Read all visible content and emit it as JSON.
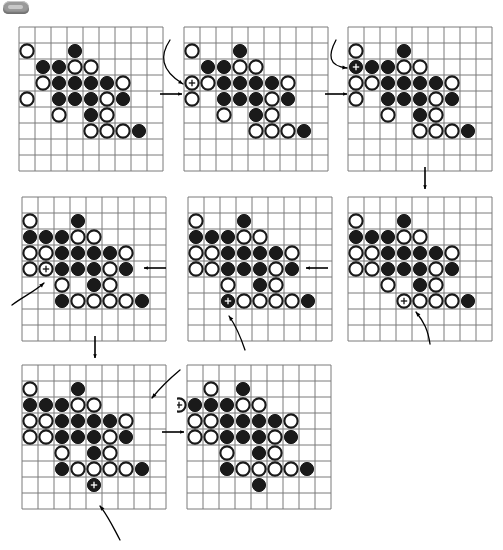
{
  "page": {
    "tab_chip_label": "",
    "background_color": "#ffffff",
    "stone_black_color": "#1a1a1a",
    "stone_white_color": "#ffffff",
    "grid_line_color": "#7a7a7a",
    "arrow_color": "#000000"
  },
  "board_spec": {
    "cols": 9,
    "rows": 9,
    "cell_px": 16,
    "stone_radius_px": 6.6,
    "note": "stones sit at cell centres, col/row are 0-indexed from top-left"
  },
  "boards": [
    {
      "id": "board-1",
      "label": "position-1",
      "x": 19,
      "y": 27,
      "black": [
        [
          3,
          1
        ],
        [
          1,
          2
        ],
        [
          2,
          2
        ],
        [
          2,
          3
        ],
        [
          3,
          3
        ],
        [
          4,
          3
        ],
        [
          5,
          3
        ],
        [
          2,
          4
        ],
        [
          3,
          4
        ],
        [
          4,
          4
        ],
        [
          6,
          4
        ],
        [
          4,
          5
        ],
        [
          7,
          6
        ]
      ],
      "white": [
        [
          0,
          1
        ],
        [
          3,
          2
        ],
        [
          4,
          2
        ],
        [
          1,
          3
        ],
        [
          6,
          3
        ],
        [
          0,
          4
        ],
        [
          5,
          4
        ],
        [
          2,
          5
        ],
        [
          5,
          5
        ],
        [
          4,
          6
        ],
        [
          5,
          6
        ],
        [
          6,
          6
        ]
      ],
      "marked": []
    },
    {
      "id": "board-2",
      "label": "position-2",
      "x": 184,
      "y": 27,
      "black": [
        [
          3,
          1
        ],
        [
          1,
          2
        ],
        [
          2,
          2
        ],
        [
          2,
          3
        ],
        [
          3,
          3
        ],
        [
          4,
          3
        ],
        [
          5,
          3
        ],
        [
          2,
          4
        ],
        [
          3,
          4
        ],
        [
          4,
          4
        ],
        [
          6,
          4
        ],
        [
          4,
          5
        ],
        [
          7,
          6
        ]
      ],
      "white": [
        [
          0,
          1
        ],
        [
          3,
          2
        ],
        [
          4,
          2
        ],
        [
          0,
          3
        ],
        [
          1,
          3
        ],
        [
          6,
          3
        ],
        [
          0,
          4
        ],
        [
          5,
          4
        ],
        [
          2,
          5
        ],
        [
          5,
          5
        ],
        [
          4,
          6
        ],
        [
          5,
          6
        ],
        [
          6,
          6
        ]
      ],
      "marked": [
        [
          0,
          3
        ]
      ]
    },
    {
      "id": "board-3",
      "label": "position-3",
      "x": 348,
      "y": 27,
      "black": [
        [
          3,
          1
        ],
        [
          0,
          2
        ],
        [
          1,
          2
        ],
        [
          2,
          2
        ],
        [
          2,
          3
        ],
        [
          3,
          3
        ],
        [
          4,
          3
        ],
        [
          5,
          3
        ],
        [
          2,
          4
        ],
        [
          3,
          4
        ],
        [
          4,
          4
        ],
        [
          6,
          4
        ],
        [
          4,
          5
        ],
        [
          7,
          6
        ]
      ],
      "white": [
        [
          0,
          1
        ],
        [
          3,
          2
        ],
        [
          4,
          2
        ],
        [
          0,
          3
        ],
        [
          1,
          3
        ],
        [
          6,
          3
        ],
        [
          0,
          4
        ],
        [
          5,
          4
        ],
        [
          2,
          5
        ],
        [
          5,
          5
        ],
        [
          4,
          6
        ],
        [
          5,
          6
        ],
        [
          6,
          6
        ]
      ],
      "marked": [
        [
          0,
          2
        ]
      ]
    },
    {
      "id": "board-4",
      "label": "position-4",
      "x": 348,
      "y": 197,
      "black": [
        [
          3,
          1
        ],
        [
          0,
          2
        ],
        [
          1,
          2
        ],
        [
          2,
          2
        ],
        [
          2,
          3
        ],
        [
          3,
          3
        ],
        [
          4,
          3
        ],
        [
          5,
          3
        ],
        [
          2,
          4
        ],
        [
          3,
          4
        ],
        [
          4,
          4
        ],
        [
          6,
          4
        ],
        [
          4,
          5
        ],
        [
          7,
          6
        ]
      ],
      "white": [
        [
          0,
          1
        ],
        [
          3,
          2
        ],
        [
          4,
          2
        ],
        [
          0,
          3
        ],
        [
          1,
          3
        ],
        [
          6,
          3
        ],
        [
          0,
          4
        ],
        [
          1,
          4
        ],
        [
          5,
          4
        ],
        [
          2,
          5
        ],
        [
          5,
          5
        ],
        [
          3,
          6
        ],
        [
          4,
          6
        ],
        [
          5,
          6
        ],
        [
          6,
          6
        ]
      ],
      "marked": [
        [
          3,
          6
        ]
      ]
    },
    {
      "id": "board-5",
      "label": "position-5",
      "x": 188,
      "y": 197,
      "black": [
        [
          3,
          1
        ],
        [
          0,
          2
        ],
        [
          1,
          2
        ],
        [
          2,
          2
        ],
        [
          2,
          3
        ],
        [
          3,
          3
        ],
        [
          4,
          3
        ],
        [
          5,
          3
        ],
        [
          2,
          4
        ],
        [
          3,
          4
        ],
        [
          4,
          4
        ],
        [
          6,
          4
        ],
        [
          4,
          5
        ],
        [
          2,
          6
        ],
        [
          7,
          6
        ]
      ],
      "white": [
        [
          0,
          1
        ],
        [
          3,
          2
        ],
        [
          4,
          2
        ],
        [
          0,
          3
        ],
        [
          1,
          3
        ],
        [
          6,
          3
        ],
        [
          0,
          4
        ],
        [
          1,
          4
        ],
        [
          5,
          4
        ],
        [
          2,
          5
        ],
        [
          5,
          5
        ],
        [
          3,
          6
        ],
        [
          4,
          6
        ],
        [
          5,
          6
        ],
        [
          6,
          6
        ]
      ],
      "marked": [
        [
          2,
          6
        ]
      ]
    },
    {
      "id": "board-6",
      "label": "position-6",
      "x": 22,
      "y": 197,
      "black": [
        [
          3,
          1
        ],
        [
          0,
          2
        ],
        [
          1,
          2
        ],
        [
          2,
          2
        ],
        [
          2,
          3
        ],
        [
          3,
          3
        ],
        [
          4,
          3
        ],
        [
          5,
          3
        ],
        [
          2,
          4
        ],
        [
          3,
          4
        ],
        [
          4,
          4
        ],
        [
          6,
          4
        ],
        [
          4,
          5
        ],
        [
          2,
          6
        ],
        [
          7,
          6
        ]
      ],
      "white": [
        [
          0,
          1
        ],
        [
          3,
          2
        ],
        [
          4,
          2
        ],
        [
          0,
          3
        ],
        [
          1,
          3
        ],
        [
          6,
          3
        ],
        [
          0,
          4
        ],
        [
          1,
          4
        ],
        [
          5,
          4
        ],
        [
          2,
          5
        ],
        [
          5,
          5
        ],
        [
          3,
          6
        ],
        [
          4,
          6
        ],
        [
          5,
          6
        ],
        [
          6,
          6
        ]
      ],
      "marked": [
        [
          1,
          4
        ]
      ]
    },
    {
      "id": "board-7",
      "label": "position-7",
      "x": 22,
      "y": 365,
      "black": [
        [
          3,
          1
        ],
        [
          0,
          2
        ],
        [
          1,
          2
        ],
        [
          2,
          2
        ],
        [
          2,
          3
        ],
        [
          3,
          3
        ],
        [
          4,
          3
        ],
        [
          5,
          3
        ],
        [
          2,
          4
        ],
        [
          3,
          4
        ],
        [
          4,
          4
        ],
        [
          6,
          4
        ],
        [
          4,
          5
        ],
        [
          2,
          6
        ],
        [
          7,
          6
        ],
        [
          4,
          7
        ]
      ],
      "white": [
        [
          0,
          1
        ],
        [
          3,
          2
        ],
        [
          4,
          2
        ],
        [
          0,
          3
        ],
        [
          1,
          3
        ],
        [
          6,
          3
        ],
        [
          0,
          4
        ],
        [
          1,
          4
        ],
        [
          5,
          4
        ],
        [
          2,
          5
        ],
        [
          5,
          5
        ],
        [
          3,
          6
        ],
        [
          4,
          6
        ],
        [
          5,
          6
        ],
        [
          6,
          6
        ]
      ],
      "marked": [
        [
          4,
          7
        ]
      ]
    },
    {
      "id": "board-8",
      "label": "position-8",
      "x": 187,
      "y": 365,
      "black": [
        [
          3,
          1
        ],
        [
          0,
          2
        ],
        [
          1,
          2
        ],
        [
          2,
          2
        ],
        [
          2,
          3
        ],
        [
          3,
          3
        ],
        [
          4,
          3
        ],
        [
          5,
          3
        ],
        [
          2,
          4
        ],
        [
          3,
          4
        ],
        [
          4,
          4
        ],
        [
          6,
          4
        ],
        [
          4,
          5
        ],
        [
          2,
          6
        ],
        [
          7,
          6
        ],
        [
          4,
          7
        ]
      ],
      "white": [
        [
          1,
          1
        ],
        [
          -1,
          2
        ],
        [
          3,
          2
        ],
        [
          4,
          2
        ],
        [
          0,
          3
        ],
        [
          1,
          3
        ],
        [
          6,
          3
        ],
        [
          0,
          4
        ],
        [
          1,
          4
        ],
        [
          5,
          4
        ],
        [
          2,
          5
        ],
        [
          5,
          5
        ],
        [
          3,
          6
        ],
        [
          4,
          6
        ],
        [
          5,
          6
        ],
        [
          6,
          6
        ]
      ],
      "marked": [
        [
          -1,
          2
        ]
      ]
    }
  ],
  "arrows": [
    {
      "id": "arrow-1-2",
      "kind": "straight",
      "from": "board-1",
      "to": "board-2",
      "x": 160,
      "y": 94,
      "dx": 22,
      "dy": 0
    },
    {
      "id": "arrow-2-3",
      "kind": "straight",
      "from": "board-2",
      "to": "board-3",
      "x": 325,
      "y": 94,
      "dx": 22,
      "dy": 0
    },
    {
      "id": "arrow-3-4",
      "kind": "straight",
      "from": "board-3",
      "to": "board-4",
      "x": 420,
      "y": 172,
      "dx": 0,
      "dy": 22
    },
    {
      "id": "arrow-4-5",
      "kind": "straight",
      "from": "board-4",
      "to": "board-5",
      "x": 326,
      "y": 268,
      "dx": -22,
      "dy": 0
    },
    {
      "id": "arrow-5-6",
      "kind": "straight",
      "from": "board-5",
      "to": "board-6",
      "x": 164,
      "y": 268,
      "dx": -22,
      "dy": 0
    },
    {
      "id": "arrow-6-7",
      "kind": "straight",
      "from": "board-6",
      "to": "board-7",
      "x": 90,
      "y": 341,
      "dx": 0,
      "dy": 22
    },
    {
      "id": "arrow-7-8",
      "kind": "straight",
      "from": "board-7",
      "to": "board-8",
      "x": 162,
      "y": 432,
      "dx": 22,
      "dy": 0
    },
    {
      "id": "callout-2",
      "kind": "curved",
      "target_board": "board-2",
      "points": "M170,40 C160,55 160,70 183,84",
      "tip": [
        183,
        84
      ]
    },
    {
      "id": "callout-3",
      "kind": "curved",
      "target_board": "board-3",
      "points": "M336,40 C328,55 328,66 347,68",
      "tip": [
        347,
        68
      ]
    },
    {
      "id": "callout-4",
      "kind": "curved",
      "target_board": "board-4",
      "points": "M430,344 C428,330 424,322 416,312",
      "tip": [
        416,
        312
      ]
    },
    {
      "id": "callout-5",
      "kind": "curved",
      "target_board": "board-5",
      "points": "M245,350 C240,335 236,326 229,316",
      "tip": [
        229,
        316
      ]
    },
    {
      "id": "callout-6",
      "kind": "curved",
      "target_board": "board-6",
      "points": "M12,305 C24,296 34,292 44,283",
      "tip": [
        44,
        283
      ]
    },
    {
      "id": "callout-7",
      "kind": "curved",
      "target_board": "board-7",
      "points": "M180,370 C168,380 160,388 152,398",
      "tip": [
        152,
        398
      ]
    },
    {
      "id": "callout-8",
      "kind": "curved",
      "target_board": "board-8",
      "points": "M120,540 C112,525 108,516 100,506",
      "tip": [
        100,
        506
      ]
    }
  ]
}
